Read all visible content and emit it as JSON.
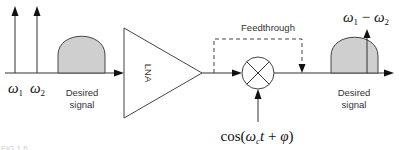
{
  "diagram": {
    "input_spectrum": {
      "tone1_label_base": "ω",
      "tone1_label_sub": "1",
      "tone2_label_base": "ω",
      "tone2_label_sub": "2",
      "signal_label_line1": "Desired",
      "signal_label_line2": "signal"
    },
    "lna": {
      "label": "LNA"
    },
    "feedthrough": {
      "label": "Feedthrough"
    },
    "mixer": {
      "lo_label_prefix": "cos(",
      "lo_label_omega": "ω",
      "lo_label_sub": "c",
      "lo_label_t": "t",
      "lo_label_plus": " + ",
      "lo_label_phi": "φ",
      "lo_label_suffix": ")"
    },
    "output_spectrum": {
      "im_label_w1": "ω",
      "im_label_sub1": "1",
      "im_label_minus": " − ",
      "im_label_w2": "ω",
      "im_label_sub2": "2",
      "signal_label_line1": "Desired",
      "signal_label_line2": "signal"
    },
    "colors": {
      "signal_fill": "#cfcfcf",
      "line": "#333333"
    }
  },
  "caption": {
    "text": "FIG 1.6"
  }
}
